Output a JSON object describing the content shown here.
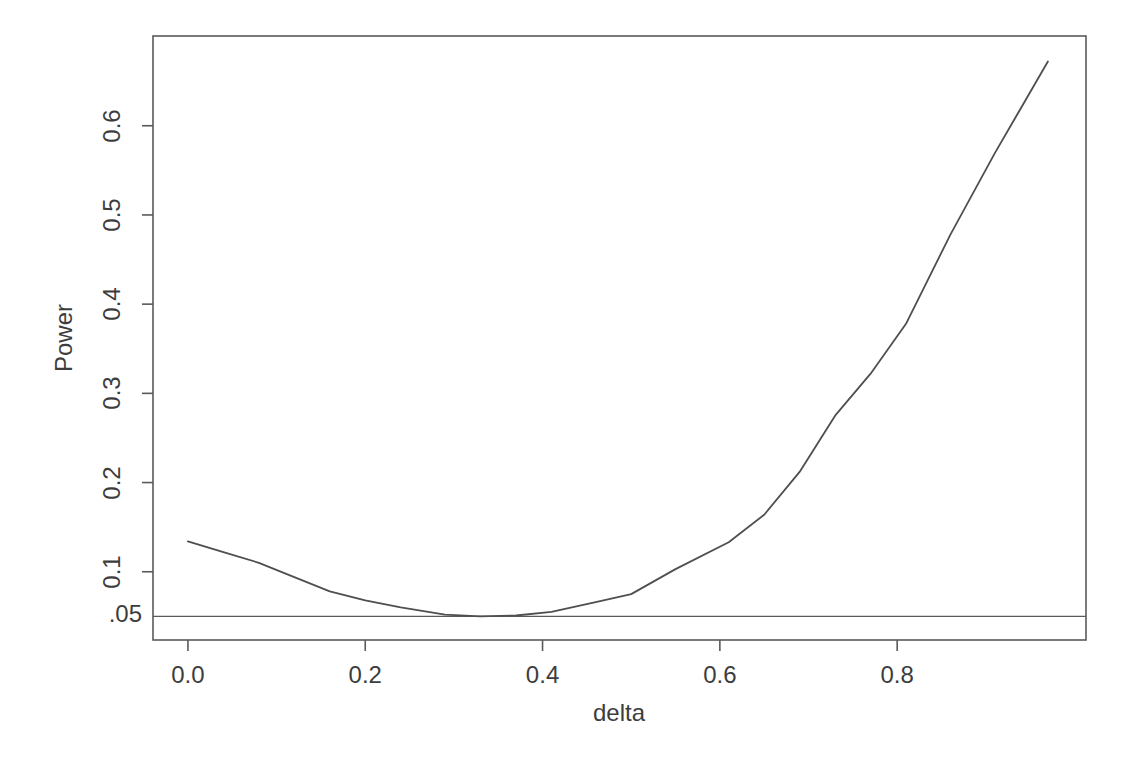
{
  "chart_data": {
    "type": "line",
    "title": "",
    "xlabel": "delta",
    "ylabel": "Power",
    "grid": false,
    "legend": "none",
    "xlim": [
      -0.0394,
      1.013
    ],
    "ylim": [
      0.0235,
      0.7006
    ],
    "x_ticks": [
      {
        "value": 0.0,
        "label": "0.0"
      },
      {
        "value": 0.2,
        "label": "0.2"
      },
      {
        "value": 0.4,
        "label": "0.4"
      },
      {
        "value": 0.6,
        "label": "0.6"
      },
      {
        "value": 0.8,
        "label": "0.8"
      }
    ],
    "y_ticks": [
      {
        "value": 0.1,
        "label": "0.1"
      },
      {
        "value": 0.2,
        "label": "0.2"
      },
      {
        "value": 0.3,
        "label": "0.3"
      },
      {
        "value": 0.4,
        "label": "0.4"
      },
      {
        "value": 0.5,
        "label": "0.5"
      },
      {
        "value": 0.6,
        "label": "0.6"
      }
    ],
    "reference_line": {
      "y": 0.05,
      "label": ".05"
    },
    "series": [
      {
        "name": "power-curve",
        "points": [
          [
            0.0,
            0.134
          ],
          [
            0.04,
            0.122
          ],
          [
            0.08,
            0.11
          ],
          [
            0.12,
            0.094
          ],
          [
            0.16,
            0.078
          ],
          [
            0.2,
            0.068
          ],
          [
            0.24,
            0.06
          ],
          [
            0.29,
            0.052
          ],
          [
            0.33,
            0.05
          ],
          [
            0.37,
            0.051
          ],
          [
            0.41,
            0.055
          ],
          [
            0.46,
            0.066
          ],
          [
            0.5,
            0.075
          ],
          [
            0.55,
            0.103
          ],
          [
            0.61,
            0.133
          ],
          [
            0.65,
            0.164
          ],
          [
            0.69,
            0.212
          ],
          [
            0.73,
            0.275
          ],
          [
            0.77,
            0.322
          ],
          [
            0.81,
            0.378
          ],
          [
            0.86,
            0.478
          ],
          [
            0.91,
            0.569
          ],
          [
            0.97,
            0.672
          ]
        ]
      }
    ],
    "colors": {
      "background": "#ffffff",
      "axis": "#5a5a5a",
      "curve": "#4f4f4f",
      "reference_line": "#5a5a5a",
      "text": "#3d3d3d"
    }
  }
}
